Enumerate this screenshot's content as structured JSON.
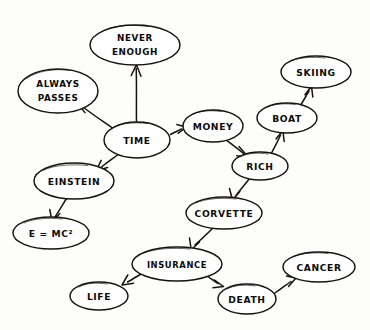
{
  "diagram": {
    "kind": "hand-drawn-concept-map",
    "title": "",
    "background_color": "#fdfdfc",
    "ink_color": "#15130f",
    "nodes": [
      {
        "id": "never-enough",
        "label": "NEVER",
        "label2": "ENOUGH",
        "cx": 135,
        "cy": 45,
        "rx": 45,
        "ry": 20
      },
      {
        "id": "always-passes",
        "label": "ALWAYS",
        "label2": "PASSES",
        "cx": 58,
        "cy": 91,
        "rx": 40,
        "ry": 22
      },
      {
        "id": "skiing",
        "label": "SKIING",
        "label2": "",
        "cx": 316,
        "cy": 72,
        "rx": 35,
        "ry": 16
      },
      {
        "id": "boat",
        "label": "BOAT",
        "label2": "",
        "cx": 287,
        "cy": 118,
        "rx": 30,
        "ry": 15
      },
      {
        "id": "time",
        "label": "TIME",
        "label2": "",
        "cx": 137,
        "cy": 140,
        "rx": 33,
        "ry": 18
      },
      {
        "id": "money",
        "label": "MONEY",
        "label2": "",
        "cx": 213,
        "cy": 126,
        "rx": 30,
        "ry": 16
      },
      {
        "id": "rich",
        "label": "RICH",
        "label2": "",
        "cx": 260,
        "cy": 166,
        "rx": 28,
        "ry": 14
      },
      {
        "id": "einstein",
        "label": "EINSTEIN",
        "label2": "",
        "cx": 74,
        "cy": 181,
        "rx": 40,
        "ry": 18
      },
      {
        "id": "corvette",
        "label": "CORVETTE",
        "label2": "",
        "cx": 224,
        "cy": 213,
        "rx": 38,
        "ry": 16
      },
      {
        "id": "e-mc2",
        "label": "E = MC²",
        "label2": "",
        "cx": 51,
        "cy": 233,
        "rx": 38,
        "ry": 16
      },
      {
        "id": "insurance",
        "label": "INSURANCE",
        "label2": "",
        "cx": 177,
        "cy": 264,
        "rx": 45,
        "ry": 17
      },
      {
        "id": "cancer",
        "label": "CANCER",
        "label2": "",
        "cx": 319,
        "cy": 267,
        "rx": 36,
        "ry": 15
      },
      {
        "id": "life",
        "label": "LIFE",
        "label2": "",
        "cx": 99,
        "cy": 296,
        "rx": 29,
        "ry": 14
      },
      {
        "id": "death",
        "label": "DEATH",
        "label2": "",
        "cx": 247,
        "cy": 299,
        "rx": 29,
        "ry": 15
      }
    ],
    "edges": [
      {
        "id": "time-never-enough",
        "from": "TIME",
        "to": "NEVER ENOUGH",
        "label": ""
      },
      {
        "id": "time-always-passes",
        "from": "TIME",
        "to": "ALWAYS PASSES",
        "label": ""
      },
      {
        "id": "time-einstein",
        "from": "TIME",
        "to": "EINSTEIN",
        "label": ""
      },
      {
        "id": "time-money",
        "from": "TIME",
        "to": "MONEY",
        "label": ""
      },
      {
        "id": "einstein-emc2",
        "from": "EINSTEIN",
        "to": "E = MC²",
        "label": ""
      },
      {
        "id": "money-rich",
        "from": "MONEY",
        "to": "RICH",
        "label": ""
      },
      {
        "id": "rich-boat",
        "from": "RICH",
        "to": "BOAT",
        "label": ""
      },
      {
        "id": "boat-skiing",
        "from": "BOAT",
        "to": "SKIING",
        "label": ""
      },
      {
        "id": "rich-corvette",
        "from": "RICH",
        "to": "CORVETTE",
        "label": ""
      },
      {
        "id": "corvette-insurance",
        "from": "CORVETTE",
        "to": "INSURANCE",
        "label": ""
      },
      {
        "id": "insurance-life",
        "from": "INSURANCE",
        "to": "LIFE",
        "label": ""
      },
      {
        "id": "insurance-death",
        "from": "INSURANCE",
        "to": "DEATH",
        "label": ""
      },
      {
        "id": "death-cancer",
        "from": "DEATH",
        "to": "CANCER",
        "label": ""
      }
    ]
  }
}
